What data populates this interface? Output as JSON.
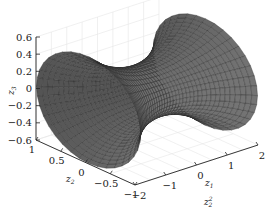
{
  "chart_data": {
    "type": "surface3d",
    "title": "",
    "surface_color": "#6e6e6e",
    "mesh_color": "#2a2a2a",
    "axes": {
      "z1": {
        "label": "z",
        "sub": "1",
        "ticks": [
          "−2",
          "−1",
          "0",
          "1",
          "2"
        ],
        "range": [
          -2,
          2
        ]
      },
      "z2": {
        "label": "z",
        "sub": "2",
        "ticks": [
          "1",
          "0.5",
          "0",
          "−0.5",
          "−1"
        ],
        "range": [
          -1,
          1
        ]
      },
      "z3": {
        "label": "z",
        "sub": "3",
        "ticks": [
          "0.6",
          "0.4",
          "0.2",
          "0",
          "−0.2",
          "−0.4",
          "−0.6"
        ],
        "range": [
          -0.6,
          0.6
        ]
      }
    },
    "grid": true,
    "footer_text": {
      "label": "z",
      "sup": "2",
      "sub": "2"
    }
  }
}
